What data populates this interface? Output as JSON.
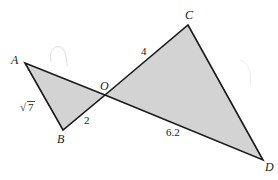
{
  "diagram": {
    "type": "geometry",
    "colors": {
      "fill": "#d3d3d3",
      "stroke": "#1a1a1a",
      "background": "#ffffff",
      "faint_mark": "#e4e4e4"
    },
    "points": {
      "A": {
        "label": "A",
        "x": 25,
        "y": 63
      },
      "B": {
        "label": "B",
        "x": 63,
        "y": 130
      },
      "O": {
        "label": "O",
        "x": 105,
        "y": 95
      },
      "C": {
        "label": "C",
        "x": 188,
        "y": 25
      },
      "D": {
        "label": "D",
        "x": 263,
        "y": 160
      }
    },
    "triangles": [
      {
        "name": "AOB",
        "vertices": [
          "A",
          "O",
          "B"
        ]
      },
      {
        "name": "COD",
        "vertices": [
          "C",
          "O",
          "D"
        ]
      }
    ],
    "segment_labels": {
      "AB": "√7",
      "AB_radicand": "7",
      "AB_radical": "√",
      "OB": "2",
      "OC": "4",
      "OD": "6.2"
    }
  }
}
